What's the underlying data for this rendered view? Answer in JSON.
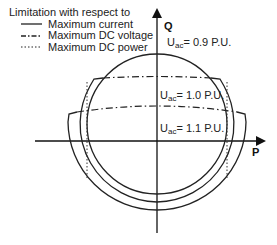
{
  "legend": {
    "title": "Limitation with respect to",
    "items": [
      {
        "label": "Maximum current",
        "style": "solid"
      },
      {
        "label": "Maximum DC voltage",
        "style": "dash-dot"
      },
      {
        "label": "Maximum DC power",
        "style": "dotted"
      }
    ]
  },
  "axes": {
    "x_label": "P",
    "y_label": "Q"
  },
  "curves": [
    {
      "name": "U_ac = 0.9 P.U.",
      "symbol": "U",
      "subscript": "ac",
      "value": "= 0.9 P.U."
    },
    {
      "name": "U_ac = 1.0 P.U.",
      "symbol": "U",
      "subscript": "ac",
      "value": "= 1.0 P.U."
    },
    {
      "name": "U_ac = 1.1 P.U.",
      "symbol": "U",
      "subscript": "ac",
      "value": "= 1.1 P.U."
    }
  ],
  "colors": {
    "line": "#222222",
    "background": "#ffffff"
  }
}
